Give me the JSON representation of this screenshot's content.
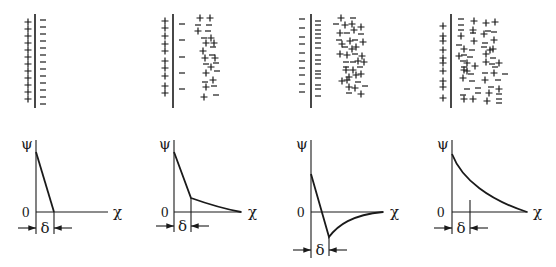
{
  "diagram": {
    "axis_labels": {
      "y": "ψ",
      "x": "χ",
      "origin": "0",
      "delta": "δ"
    },
    "ink_color": "#1a1a1a",
    "background": "#ffffff",
    "panels": [
      {
        "id": "helmholtz",
        "description": "Compact layer only: + charges on surface, - counter-ions in a single row",
        "surface_x": 35,
        "left_charges": {
          "sign": "+",
          "x": 28,
          "ys": [
            22,
            29,
            36,
            43,
            50,
            57,
            64,
            71,
            78,
            85,
            92,
            99
          ]
        },
        "inner_charges": {
          "sign": "-",
          "x": 43,
          "ys": [
            20,
            27,
            34,
            41,
            48,
            55,
            62,
            69,
            76,
            83,
            90,
            97,
            104
          ]
        },
        "diffuse_charges": [],
        "graph": {
          "axis_x": 36,
          "baseline_y": 212,
          "axis_top": 140,
          "axis_right": 108,
          "curve": "M36,152 L54,212",
          "delta_x": 54,
          "arrow_y": 228,
          "origin_label_x": 22,
          "chi_x": 113
        }
      },
      {
        "id": "stern",
        "description": "Stern model: compact layer plus diffuse layer",
        "surface_x": 173,
        "left_charges": {
          "sign": "+",
          "x": 165,
          "ys": [
            21,
            28,
            36,
            44,
            51,
            61,
            68,
            76,
            86,
            93
          ]
        },
        "inner_charges": {
          "sign": "-",
          "x": 182,
          "ys": [
            24,
            40,
            57,
            73,
            89
          ]
        },
        "diffuse_charges": [
          {
            "s": "+",
            "x": 200,
            "y": 18
          },
          {
            "s": "+",
            "x": 210,
            "y": 18
          },
          {
            "s": "-",
            "x": 198,
            "y": 25
          },
          {
            "s": "-",
            "x": 209,
            "y": 25
          },
          {
            "s": "+",
            "x": 198,
            "y": 31
          },
          {
            "s": "-",
            "x": 208,
            "y": 31
          },
          {
            "s": "-",
            "x": 204,
            "y": 38
          },
          {
            "s": "+",
            "x": 211,
            "y": 38
          },
          {
            "s": "+",
            "x": 206,
            "y": 43
          },
          {
            "s": "+",
            "x": 214,
            "y": 43
          },
          {
            "s": "+",
            "x": 203,
            "y": 51
          },
          {
            "s": "-",
            "x": 213,
            "y": 47
          },
          {
            "s": "-",
            "x": 212,
            "y": 55
          },
          {
            "s": "+",
            "x": 215,
            "y": 58
          },
          {
            "s": "+",
            "x": 205,
            "y": 58
          },
          {
            "s": "-",
            "x": 216,
            "y": 63
          },
          {
            "s": "-",
            "x": 206,
            "y": 64
          },
          {
            "s": "+",
            "x": 211,
            "y": 67
          },
          {
            "s": "-",
            "x": 217,
            "y": 71
          },
          {
            "s": "+",
            "x": 206,
            "y": 73
          },
          {
            "s": "+",
            "x": 213,
            "y": 80
          },
          {
            "s": "-",
            "x": 205,
            "y": 82
          },
          {
            "s": "+",
            "x": 206,
            "y": 87
          },
          {
            "s": "-",
            "x": 214,
            "y": 86
          },
          {
            "s": "+",
            "x": 204,
            "y": 97
          },
          {
            "s": "-",
            "x": 216,
            "y": 95
          }
        ],
        "graph": {
          "axis_x": 174,
          "baseline_y": 212,
          "axis_top": 140,
          "axis_right": 242,
          "curve": "M174,152 L191,198 C205,203 220,208 241,212",
          "delta_x": 191,
          "arrow_y": 226,
          "origin_label_x": 161,
          "chi_x": 248
        }
      },
      {
        "id": "specific_adsorption",
        "description": "Superequivalent adsorption: potential reverses sign in compact layer",
        "surface_x": 311,
        "left_charges": {
          "sign": "-",
          "x": 302,
          "ys": [
            19,
            28,
            37,
            44,
            53,
            61,
            68,
            75,
            84,
            92
          ]
        },
        "inner_charges": {
          "sign": "-",
          "x": 318,
          "ys": [
            21,
            25,
            30,
            34,
            38,
            43,
            48,
            55,
            60,
            64,
            71,
            74,
            78,
            85,
            89,
            96
          ]
        },
        "diffuse_charges": [
          {
            "s": "+",
            "x": 341,
            "y": 18
          },
          {
            "s": "-",
            "x": 353,
            "y": 18
          },
          {
            "s": "-",
            "x": 336,
            "y": 24
          },
          {
            "s": "+",
            "x": 345,
            "y": 25
          },
          {
            "s": "+",
            "x": 352,
            "y": 24
          },
          {
            "s": "+",
            "x": 361,
            "y": 27
          },
          {
            "s": "+",
            "x": 340,
            "y": 33
          },
          {
            "s": "-",
            "x": 347,
            "y": 33
          },
          {
            "s": "+",
            "x": 354,
            "y": 30
          },
          {
            "s": "-",
            "x": 361,
            "y": 34
          },
          {
            "s": "-",
            "x": 339,
            "y": 40
          },
          {
            "s": "+",
            "x": 342,
            "y": 44
          },
          {
            "s": "+",
            "x": 350,
            "y": 41
          },
          {
            "s": "-",
            "x": 355,
            "y": 40
          },
          {
            "s": "+",
            "x": 363,
            "y": 42
          },
          {
            "s": "-",
            "x": 345,
            "y": 47
          },
          {
            "s": "+",
            "x": 352,
            "y": 49
          },
          {
            "s": "+",
            "x": 356,
            "y": 47
          },
          {
            "s": "+",
            "x": 340,
            "y": 54
          },
          {
            "s": "+",
            "x": 347,
            "y": 55
          },
          {
            "s": "-",
            "x": 355,
            "y": 54
          },
          {
            "s": "+",
            "x": 362,
            "y": 56
          },
          {
            "s": "-",
            "x": 346,
            "y": 62
          },
          {
            "s": "-",
            "x": 353,
            "y": 62
          },
          {
            "s": "+",
            "x": 358,
            "y": 61
          },
          {
            "s": "+",
            "x": 364,
            "y": 62
          },
          {
            "s": "-",
            "x": 346,
            "y": 67
          },
          {
            "s": "+",
            "x": 346,
            "y": 70
          },
          {
            "s": "+",
            "x": 353,
            "y": 70
          },
          {
            "s": "-",
            "x": 360,
            "y": 67
          },
          {
            "s": "+",
            "x": 349,
            "y": 77
          },
          {
            "s": "+",
            "x": 356,
            "y": 75
          },
          {
            "s": "+",
            "x": 361,
            "y": 74
          },
          {
            "s": "+",
            "x": 342,
            "y": 81
          },
          {
            "s": "+",
            "x": 347,
            "y": 80
          },
          {
            "s": "-",
            "x": 358,
            "y": 82
          },
          {
            "s": "+",
            "x": 349,
            "y": 87
          },
          {
            "s": "+",
            "x": 355,
            "y": 88
          },
          {
            "s": "-",
            "x": 365,
            "y": 86
          },
          {
            "s": "-",
            "x": 349,
            "y": 93
          },
          {
            "s": "+",
            "x": 361,
            "y": 94
          }
        ],
        "graph": {
          "axis_x": 311,
          "baseline_y": 212,
          "axis_top": 140,
          "axis_right": 384,
          "curve": "M311,174 L329,237 C338,225 352,215 383,212",
          "delta_x": 329,
          "arrow_y": 250,
          "origin_label_x": 297,
          "chi_x": 390
        }
      },
      {
        "id": "gouy_chapman",
        "description": "Diffuse layer only: potential decays exponentially",
        "surface_x": 451,
        "left_charges": {
          "sign": "+",
          "x": 443,
          "ys": [
            26,
            36,
            41,
            50,
            58,
            63,
            71,
            81,
            87,
            98
          ]
        },
        "inner_charges": {
          "sign": "-",
          "x": 0,
          "ys": []
        },
        "diffuse_charges": [
          {
            "s": "-",
            "x": 461,
            "y": 19
          },
          {
            "s": "+",
            "x": 474,
            "y": 21
          },
          {
            "s": "+",
            "x": 486,
            "y": 23
          },
          {
            "s": "+",
            "x": 495,
            "y": 22
          },
          {
            "s": "-",
            "x": 461,
            "y": 25
          },
          {
            "s": "+",
            "x": 473,
            "y": 30
          },
          {
            "s": "-",
            "x": 488,
            "y": 31
          },
          {
            "s": "-",
            "x": 461,
            "y": 30
          },
          {
            "s": "+",
            "x": 461,
            "y": 36
          },
          {
            "s": "-",
            "x": 473,
            "y": 33
          },
          {
            "s": "+",
            "x": 484,
            "y": 34
          },
          {
            "s": "-",
            "x": 494,
            "y": 32
          },
          {
            "s": "+",
            "x": 474,
            "y": 41
          },
          {
            "s": "-",
            "x": 485,
            "y": 43
          },
          {
            "s": "+",
            "x": 494,
            "y": 40
          },
          {
            "s": "-",
            "x": 459,
            "y": 45
          },
          {
            "s": "+",
            "x": 464,
            "y": 49
          },
          {
            "s": "-",
            "x": 472,
            "y": 50
          },
          {
            "s": "-",
            "x": 484,
            "y": 47
          },
          {
            "s": "+",
            "x": 493,
            "y": 49
          },
          {
            "s": "+",
            "x": 486,
            "y": 54
          },
          {
            "s": "+",
            "x": 490,
            "y": 50
          },
          {
            "s": "+",
            "x": 459,
            "y": 56
          },
          {
            "s": "-",
            "x": 464,
            "y": 55
          },
          {
            "s": "-",
            "x": 470,
            "y": 57
          },
          {
            "s": "-",
            "x": 493,
            "y": 58
          },
          {
            "s": "-",
            "x": 463,
            "y": 61
          },
          {
            "s": "+",
            "x": 467,
            "y": 63
          },
          {
            "s": "+",
            "x": 486,
            "y": 62
          },
          {
            "s": "-",
            "x": 492,
            "y": 64
          },
          {
            "s": "+",
            "x": 499,
            "y": 63
          },
          {
            "s": "-",
            "x": 464,
            "y": 67
          },
          {
            "s": "+",
            "x": 475,
            "y": 66
          },
          {
            "s": "-",
            "x": 495,
            "y": 67
          },
          {
            "s": "+",
            "x": 464,
            "y": 70
          },
          {
            "s": "+",
            "x": 467,
            "y": 71
          },
          {
            "s": "-",
            "x": 471,
            "y": 74
          },
          {
            "s": "-",
            "x": 485,
            "y": 73
          },
          {
            "s": "+",
            "x": 494,
            "y": 73
          },
          {
            "s": "-",
            "x": 505,
            "y": 74
          },
          {
            "s": "+",
            "x": 463,
            "y": 78
          },
          {
            "s": "-",
            "x": 472,
            "y": 81
          },
          {
            "s": "+",
            "x": 485,
            "y": 80
          },
          {
            "s": "-",
            "x": 498,
            "y": 80
          },
          {
            "s": "-",
            "x": 467,
            "y": 89
          },
          {
            "s": "-",
            "x": 478,
            "y": 88
          },
          {
            "s": "-",
            "x": 491,
            "y": 87
          },
          {
            "s": "+",
            "x": 499,
            "y": 89
          },
          {
            "s": "-",
            "x": 478,
            "y": 93
          },
          {
            "s": "+",
            "x": 489,
            "y": 93
          },
          {
            "s": "-",
            "x": 499,
            "y": 94
          },
          {
            "s": "-",
            "x": 463,
            "y": 95
          },
          {
            "s": "+",
            "x": 464,
            "y": 99
          },
          {
            "s": "+",
            "x": 473,
            "y": 99
          },
          {
            "s": "+",
            "x": 487,
            "y": 101
          },
          {
            "s": "-",
            "x": 499,
            "y": 99
          },
          {
            "s": "-",
            "x": 499,
            "y": 103
          }
        ],
        "graph": {
          "axis_x": 452,
          "baseline_y": 212,
          "axis_top": 140,
          "axis_right": 528,
          "curve": "M452,154 C462,180 490,200 527,212",
          "delta_x": 470,
          "arrow_y": 228,
          "origin_label_x": 437,
          "chi_x": 533
        }
      }
    ]
  }
}
